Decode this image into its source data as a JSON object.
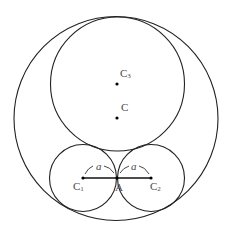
{
  "diagram": {
    "type": "geometry",
    "colors": {
      "stroke": "#222222",
      "label": "#4a4a4a",
      "background": "#ffffff"
    },
    "circles": [
      {
        "id": "outer",
        "cx": 116,
        "cy": 118.5,
        "r": 102
      },
      {
        "id": "C3",
        "cx": 117.5,
        "cy": 84,
        "r": 67
      },
      {
        "id": "C1",
        "cx": 83,
        "cy": 178,
        "r": 33.5
      },
      {
        "id": "C2",
        "cx": 151,
        "cy": 178,
        "r": 33.5
      }
    ],
    "points": [
      {
        "id": "C3",
        "x": 117,
        "y": 84,
        "label": "C",
        "sub": "3"
      },
      {
        "id": "C",
        "x": 117,
        "y": 118,
        "label": "C",
        "sub": ""
      },
      {
        "id": "C1",
        "x": 83,
        "y": 178,
        "label": "C",
        "sub": "1"
      },
      {
        "id": "A",
        "x": 117,
        "y": 178,
        "label": "A",
        "sub": ""
      },
      {
        "id": "C2",
        "x": 151,
        "y": 178,
        "label": "C",
        "sub": "2"
      }
    ],
    "segments": [
      {
        "from": "C1",
        "to": "C2"
      }
    ],
    "dimensions": [
      {
        "from": "C1",
        "to": "A",
        "label": "a"
      },
      {
        "from": "A",
        "to": "C2",
        "label": "a"
      }
    ]
  }
}
